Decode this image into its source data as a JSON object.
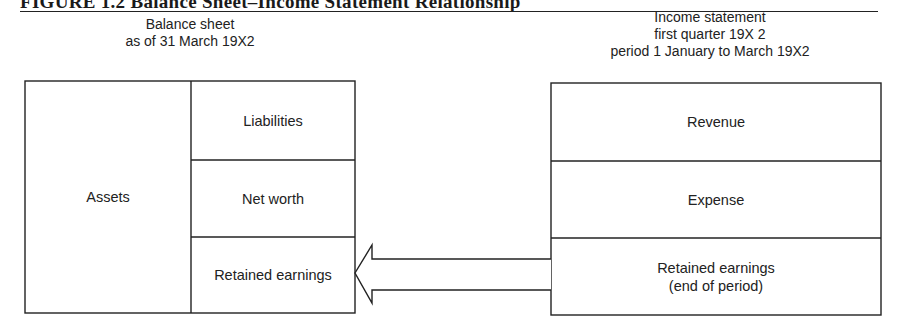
{
  "figure": {
    "title": "FIGURE 1.2 Balance Sheet–Income Statement Relationship"
  },
  "balance_sheet": {
    "caption_line1": "Balance sheet",
    "caption_line2": "as of 31 March 19X2",
    "assets_label": "Assets",
    "cells": [
      {
        "label": "Liabilities"
      },
      {
        "label": "Net worth"
      },
      {
        "label": "Retained earnings"
      }
    ]
  },
  "income_statement": {
    "caption_line1": "Income statement",
    "caption_line2": "first quarter 19X 2",
    "caption_line3": "period 1 January to March 19X2",
    "cells": [
      {
        "label": "Revenue"
      },
      {
        "label": "Expense"
      },
      {
        "label_line1": "Retained earnings",
        "label_line2": "(end of period)"
      }
    ]
  },
  "arrow": {
    "from": "income_statement.retained_earnings",
    "to": "balance_sheet.retained_earnings",
    "direction": "left"
  },
  "colors": {
    "line": "#222222",
    "background": "#ffffff"
  }
}
